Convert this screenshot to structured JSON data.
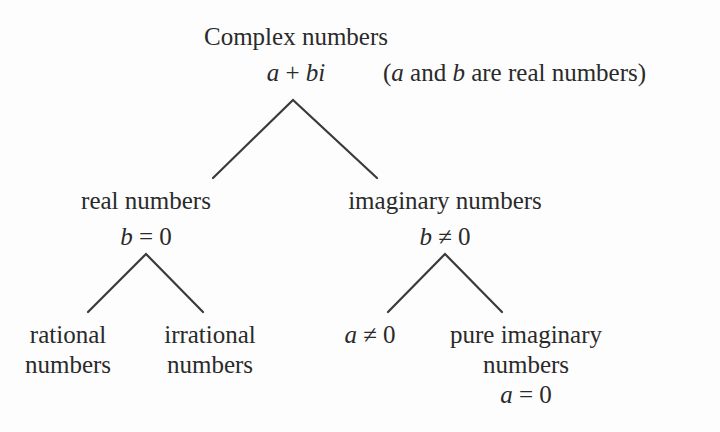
{
  "root": {
    "title": "Complex numbers",
    "form_a": "a",
    "form_plus": " + ",
    "form_bi": "bi",
    "note_open": "(",
    "note_a": "a",
    "note_mid": " and ",
    "note_b": "b",
    "note_end": " are real numbers)"
  },
  "real": {
    "title": "real numbers",
    "cond_var": "b",
    "cond_rest": " = 0",
    "children": {
      "rational": {
        "line1": "rational",
        "line2": "numbers"
      },
      "irrational": {
        "line1": "irrational",
        "line2": "numbers"
      }
    }
  },
  "imaginary": {
    "title": "imaginary numbers",
    "cond_var": "b",
    "cond_rest": " ≠ 0",
    "children": {
      "nonzero": {
        "var": "a",
        "rest": " ≠ 0"
      },
      "pure": {
        "line1": "pure imaginary",
        "line2": "numbers",
        "cond_var": "a",
        "cond_rest": " = 0"
      }
    }
  },
  "colors": {
    "line": "#3a3a3a",
    "text": "#2a2a2a",
    "background": "#fdfdfd"
  }
}
